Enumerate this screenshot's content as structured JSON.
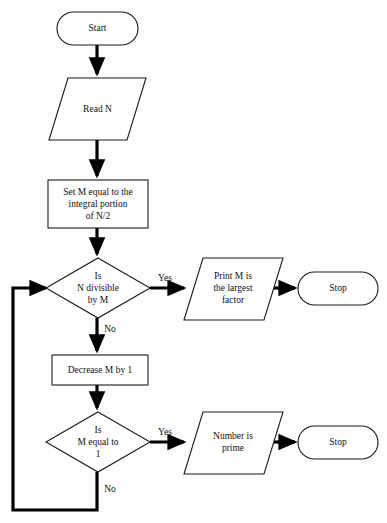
{
  "diagram": {
    "type": "flowchart",
    "background_color": "#fdfdfd",
    "line_color": "#000000",
    "shape_fill": "#ffffff",
    "shape_stroke": "#1a1a1a"
  },
  "nodes": {
    "start": {
      "shape": "terminator",
      "label": "Start"
    },
    "read_n": {
      "shape": "io-parallelogram",
      "label": "Read N"
    },
    "set_m": {
      "shape": "process-rectangle",
      "line1": "Set M equal to the",
      "line2": "integral portion",
      "line3": "of N/2"
    },
    "decision_divisible": {
      "shape": "decision-diamond",
      "line1": "Is",
      "line2": "N divisible",
      "line3": "by M"
    },
    "print_factor": {
      "shape": "io-parallelogram",
      "line1": "Print M is",
      "line2": "the largest",
      "line3": "factor"
    },
    "stop_factor": {
      "shape": "terminator",
      "label": "Stop"
    },
    "decrease_m": {
      "shape": "process-rectangle",
      "label": "Decrease M by 1"
    },
    "decision_equal_one": {
      "shape": "decision-diamond",
      "line1": "Is",
      "line2": "M equal to",
      "line3": "1"
    },
    "number_prime": {
      "shape": "io-parallelogram",
      "line1": "Number is",
      "line2": "prime"
    },
    "stop_prime": {
      "shape": "terminator",
      "label": "Stop"
    }
  },
  "branch_labels": {
    "divisible_yes": "Yes",
    "divisible_no": "No",
    "equal_one_yes": "Yes",
    "equal_one_no": "No"
  }
}
